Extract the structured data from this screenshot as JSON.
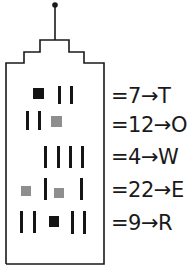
{
  "colors": {
    "outline": "#1a1a1a",
    "black_square": "#141414",
    "gray_square": "#8e8e8e",
    "background": "#ffffff"
  },
  "legend": {
    "bar": "1",
    "black_square": "5",
    "gray_square": "10"
  },
  "rows": [
    {
      "label": "=7→T",
      "value": "7",
      "letter": "T",
      "symbols": [
        "black-square",
        "bar",
        "bar"
      ]
    },
    {
      "label": "=12→O",
      "value": "12",
      "letter": "O",
      "symbols": [
        "bar",
        "bar",
        "gray-square"
      ]
    },
    {
      "label": "=4→W",
      "value": "4",
      "letter": "W",
      "symbols": [
        "bar",
        "bar",
        "bar",
        "bar"
      ]
    },
    {
      "label": "=22→E",
      "value": "22",
      "letter": "E",
      "symbols": [
        "gray-square",
        "bar",
        "gray-square",
        "bar"
      ]
    },
    {
      "label": "=9→R",
      "value": "9",
      "letter": "R",
      "symbols": [
        "bar",
        "bar",
        "black-square",
        "bar",
        "bar"
      ]
    }
  ],
  "decoded_word": "TOWER"
}
